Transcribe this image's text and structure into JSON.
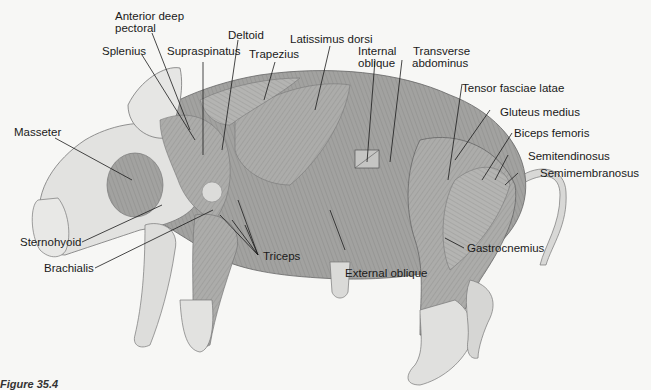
{
  "figure": {
    "caption_partial": "Figure 35.4",
    "colors": {
      "background": "#f7f7f5",
      "skin": "#e3e3e1",
      "muscle": "#a9a9a7",
      "muscle_dark": "#8e8e8c",
      "line": "#1a1a1a"
    }
  },
  "labels": {
    "anterior_deep_pectoral_1": "Anterior deep",
    "anterior_deep_pectoral_2": "pectoral",
    "deltoid": "Deltoid",
    "latissimus_dorsi": "Latissimus dorsi",
    "splenius": "Splenius",
    "supraspinatus": "Supraspinatus",
    "trapezius": "Trapezius",
    "internal_oblique_1": "Internal",
    "internal_oblique_2": "oblique",
    "transverse_abdominus_1": "Transverse",
    "transverse_abdominus_2": "abdominus",
    "tensor_fasciae_latae": "Tensor fasciae latae",
    "gluteus_medius": "Gluteus medius",
    "biceps_femoris": "Biceps femoris",
    "semitendinosus": "Semitendinosus",
    "semimembranosus": "Semimembranosus",
    "masseter": "Masseter",
    "sternohyoid": "Sternohyoid",
    "brachialis": "Brachialis",
    "triceps": "Triceps",
    "external_oblique": "External oblique",
    "gastrocnemius": "Gastrocnemius"
  }
}
